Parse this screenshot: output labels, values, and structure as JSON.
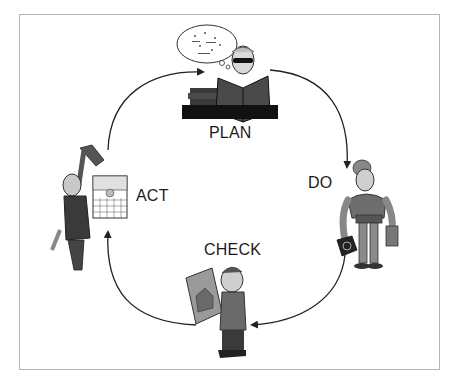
{
  "diagram": {
    "type": "cycle",
    "stages": [
      {
        "id": "plan",
        "label": "PLAN",
        "figure": "man reading book with thought bubble behind desk of books"
      },
      {
        "id": "do",
        "label": "DO",
        "figure": "worker with tool belt carrying saw and toolbox"
      },
      {
        "id": "check",
        "label": "CHECK",
        "figure": "man inspecting house blueprint"
      },
      {
        "id": "act",
        "label": "ACT",
        "figure": "man hanging from tie holding calendar"
      }
    ],
    "arrows": [
      {
        "from": "act",
        "to": "plan"
      },
      {
        "from": "plan",
        "to": "do"
      },
      {
        "from": "do",
        "to": "check"
      },
      {
        "from": "check",
        "to": "act"
      }
    ],
    "colors": {
      "frame_border": "#b4b4b4",
      "arrow": "#222222",
      "text": "#1a1a1a"
    }
  }
}
